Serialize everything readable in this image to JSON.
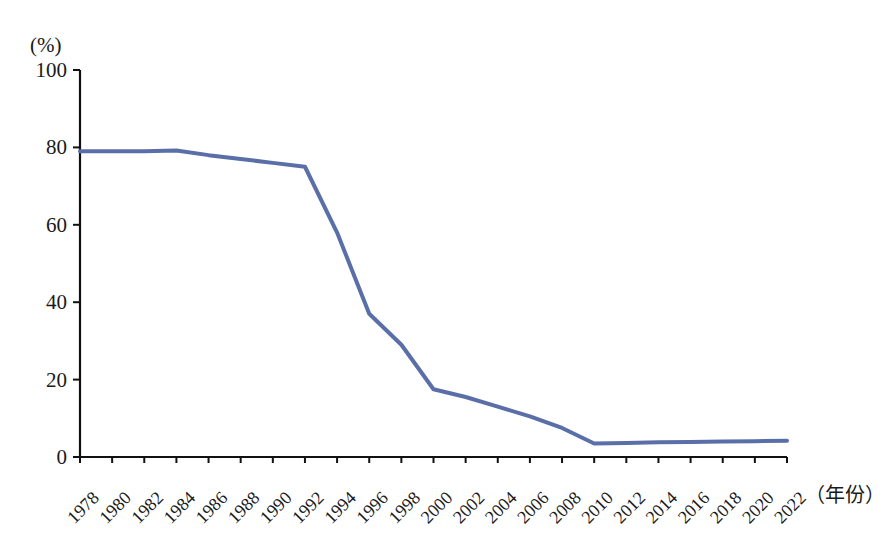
{
  "chart_data": {
    "type": "line",
    "title": "",
    "subtitle": "",
    "xlabel": "（年份）",
    "ylabel": "(%)",
    "ylim": [
      0,
      100
    ],
    "xlim": [
      1978,
      2022
    ],
    "grid": false,
    "legend": false,
    "legend_position": "none",
    "yticks": [
      0,
      20,
      40,
      60,
      80,
      100
    ],
    "ytick_labels": [
      "0",
      "20",
      "40",
      "60",
      "80",
      "100"
    ],
    "categories": [
      "1978",
      "1980",
      "1982",
      "1984",
      "1986",
      "1988",
      "1990",
      "1992",
      "1994",
      "1996",
      "1998",
      "2000",
      "2002",
      "2004",
      "2006",
      "2008",
      "2010",
      "2012",
      "2014",
      "2016",
      "2018",
      "2020",
      "2022"
    ],
    "series": [
      {
        "name": "",
        "color": "#5a6fa8",
        "values": [
          79.0,
          79.0,
          79.0,
          79.2,
          78.0,
          77.0,
          76.0,
          75.0,
          58.0,
          37.0,
          29.0,
          17.5,
          15.5,
          13.0,
          10.5,
          7.5,
          3.5,
          3.6,
          3.8,
          3.9,
          4.0,
          4.1,
          4.2
        ]
      }
    ]
  },
  "axes": {
    "y_unit_label": "(%)",
    "x_unit_label": "（年份）"
  }
}
